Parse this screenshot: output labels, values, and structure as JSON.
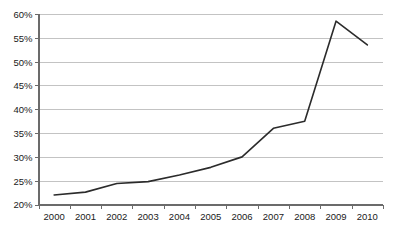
{
  "chart_data": {
    "type": "line",
    "title": "",
    "subtitle": "",
    "xlabel": "",
    "ylabel": "",
    "categories": [
      "2000",
      "2001",
      "2002",
      "2003",
      "2004",
      "2005",
      "2006",
      "2007",
      "2008",
      "2009",
      "2010"
    ],
    "series": [
      {
        "name": "",
        "values": [
          22.0,
          22.6,
          24.4,
          24.8,
          26.2,
          27.8,
          30.0,
          36.0,
          37.5,
          58.5,
          53.5
        ]
      }
    ],
    "ylim": [
      20,
      60
    ],
    "ytick_values": [
      20,
      25,
      30,
      35,
      40,
      45,
      50,
      55,
      60
    ],
    "ytick_labels": [
      "20%",
      "25%",
      "30%",
      "35%",
      "40%",
      "45%",
      "50%",
      "55%",
      "60%"
    ],
    "xtick_labels": [
      "2000",
      "2001",
      "2002",
      "2003",
      "2004",
      "2005",
      "2006",
      "2007",
      "2008",
      "2009",
      "2010"
    ],
    "grid": true,
    "grid_axis": "y",
    "legend": false,
    "legend_position": "none",
    "line_color": "#2b2b2b",
    "grid_color": "#b4b4b4",
    "axis_color": "#6b6b6b",
    "background_color": "#ffffff",
    "value_suffix": "%"
  }
}
